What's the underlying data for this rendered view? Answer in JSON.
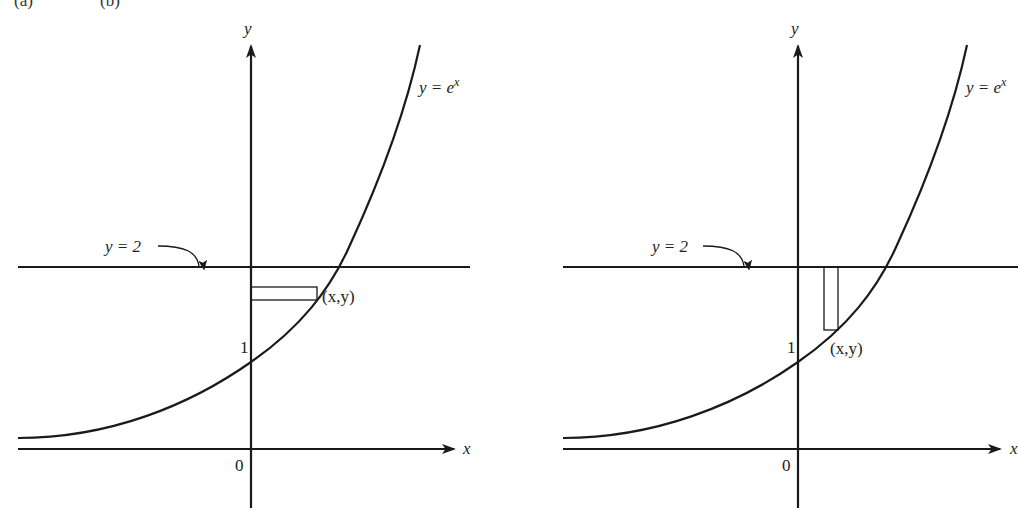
{
  "header": {
    "left_fragment": "(a)",
    "right_fragment": "(b)"
  },
  "figures": [
    {
      "id": "left",
      "axis_x_label": "x",
      "axis_y_label": "y",
      "origin_label": "0",
      "tick_1_label": "1",
      "curve_label_lhs": "y = e",
      "curve_label_exp": "x",
      "line_label": "y = 2",
      "point_label": "(x,y)",
      "strip_orientation": "horizontal"
    },
    {
      "id": "right",
      "axis_x_label": "x",
      "axis_y_label": "y",
      "origin_label": "0",
      "tick_1_label": "1",
      "curve_label_lhs": "y = e",
      "curve_label_exp": "x",
      "line_label": "y = 2",
      "point_label": "(x,y)",
      "strip_orientation": "vertical"
    }
  ],
  "colors": {
    "ink": "#1a1a1a",
    "background": "#ffffff"
  }
}
